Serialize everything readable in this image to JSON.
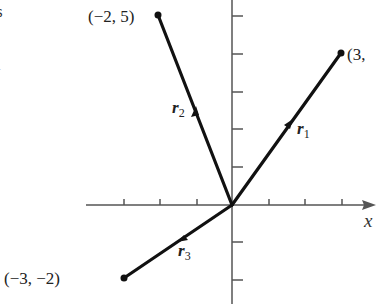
{
  "figure": {
    "origin_px": [
      232,
      205
    ],
    "unit_px": 37.5,
    "x_axis_label": "x",
    "margin_fragments": [
      "s",
      "l"
    ],
    "points": [
      {
        "name": "tip-r1",
        "coords": [
          3,
          4
        ],
        "label": "(3,"
      },
      {
        "name": "tip-r2",
        "coords": [
          -2,
          5
        ],
        "label": "(−2, 5)"
      },
      {
        "name": "tip-r3",
        "coords": [
          -3,
          -2
        ],
        "label": "(−3, −2)"
      }
    ],
    "vectors": [
      {
        "name": "r1",
        "symbol": "r",
        "subscript": "1"
      },
      {
        "name": "r2",
        "symbol": "r",
        "subscript": "2"
      },
      {
        "name": "r3",
        "symbol": "r",
        "subscript": "3"
      }
    ],
    "colors": {
      "axis": "#555555",
      "vector": "#111111",
      "text": "#222222"
    }
  }
}
